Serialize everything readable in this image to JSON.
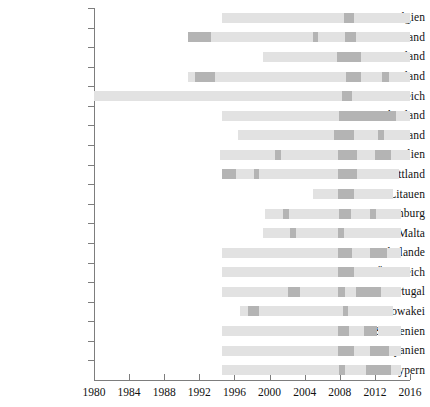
{
  "chart_data": {
    "type": "bar",
    "subtype": "horizontal-gantt-timeline",
    "title": "",
    "xlabel": "",
    "ylabel": "",
    "xlim": [
      1980,
      2016
    ],
    "xticks": [
      1980,
      1984,
      1988,
      1992,
      1996,
      2000,
      2004,
      2008,
      2012,
      2016
    ],
    "xticklabels": [
      "1980",
      "1984",
      "1988",
      "1992",
      "1996",
      "2000",
      "2004",
      "2008",
      "2012",
      "2016"
    ],
    "grid": false,
    "legend": "none",
    "colors": {
      "light": "#e2e2e2",
      "dark": "#b4b4b4",
      "axis": "#7d7d7d",
      "text": "#111111",
      "background": "#ffffff"
    },
    "categories": [
      "Belgien",
      "Deutschland",
      "Estland",
      "Finnland",
      "Frankreich",
      "Griechenland",
      "Irland",
      "Italien",
      "Lettland",
      "Litauen",
      "Luxemburg",
      "Malta",
      "Niederlande",
      "Österreich",
      "Portugal",
      "Slowakei",
      "Slowenien",
      "Spanien",
      "Zypern"
    ],
    "series": [
      {
        "name": "Belgien",
        "span": [
          1994.6,
          2016.0
        ],
        "segments": [
          {
            "start": 1994.6,
            "end": 2008.5,
            "level": "light"
          },
          {
            "start": 2008.5,
            "end": 2009.6,
            "level": "dark"
          },
          {
            "start": 2009.6,
            "end": 2016.0,
            "level": "light"
          }
        ]
      },
      {
        "name": "Deutschland",
        "span": [
          1990.7,
          2016.0
        ],
        "segments": [
          {
            "start": 1990.7,
            "end": 1993.3,
            "level": "dark"
          },
          {
            "start": 1993.3,
            "end": 2005.0,
            "level": "light"
          },
          {
            "start": 2005.0,
            "end": 2005.5,
            "level": "dark"
          },
          {
            "start": 2005.5,
            "end": 2008.6,
            "level": "light"
          },
          {
            "start": 2008.6,
            "end": 2009.8,
            "level": "dark"
          },
          {
            "start": 2009.8,
            "end": 2016.0,
            "level": "light"
          }
        ]
      },
      {
        "name": "Estland",
        "span": [
          1999.3,
          2016.0
        ],
        "segments": [
          {
            "start": 1999.3,
            "end": 2007.7,
            "level": "light"
          },
          {
            "start": 2007.7,
            "end": 2010.4,
            "level": "dark"
          },
          {
            "start": 2010.4,
            "end": 2016.0,
            "level": "light"
          }
        ]
      },
      {
        "name": "Finnland",
        "span": [
          1990.7,
          2016.0
        ],
        "segments": [
          {
            "start": 1990.7,
            "end": 1991.5,
            "level": "light"
          },
          {
            "start": 1991.5,
            "end": 1993.8,
            "level": "dark"
          },
          {
            "start": 1993.8,
            "end": 2008.7,
            "level": "light"
          },
          {
            "start": 2008.7,
            "end": 2010.4,
            "level": "dark"
          },
          {
            "start": 2010.4,
            "end": 2012.8,
            "level": "light"
          },
          {
            "start": 2012.8,
            "end": 2013.6,
            "level": "dark"
          },
          {
            "start": 2013.6,
            "end": 2016.0,
            "level": "light"
          }
        ]
      },
      {
        "name": "Frankreich",
        "span": [
          1980.0,
          2016.0
        ],
        "segments": [
          {
            "start": 1980.0,
            "end": 2008.3,
            "level": "light"
          },
          {
            "start": 2008.3,
            "end": 2009.4,
            "level": "dark"
          },
          {
            "start": 2009.4,
            "end": 2016.0,
            "level": "light"
          }
        ]
      },
      {
        "name": "Griechenland",
        "span": [
          1994.6,
          2016.0
        ],
        "segments": [
          {
            "start": 1994.6,
            "end": 2007.9,
            "level": "light"
          },
          {
            "start": 2007.9,
            "end": 2014.4,
            "level": "dark"
          },
          {
            "start": 2014.4,
            "end": 2016.0,
            "level": "light"
          }
        ]
      },
      {
        "name": "Irland",
        "span": [
          1996.4,
          2016.0
        ],
        "segments": [
          {
            "start": 1996.4,
            "end": 2007.3,
            "level": "light"
          },
          {
            "start": 2007.3,
            "end": 2009.6,
            "level": "dark"
          },
          {
            "start": 2009.6,
            "end": 2012.4,
            "level": "light"
          },
          {
            "start": 2012.4,
            "end": 2013.0,
            "level": "dark"
          },
          {
            "start": 2013.0,
            "end": 2016.0,
            "level": "light"
          }
        ]
      },
      {
        "name": "Italien",
        "span": [
          1994.4,
          2016.0
        ],
        "segments": [
          {
            "start": 1994.4,
            "end": 2000.6,
            "level": "light"
          },
          {
            "start": 2000.6,
            "end": 2001.3,
            "level": "dark"
          },
          {
            "start": 2001.3,
            "end": 2007.8,
            "level": "light"
          },
          {
            "start": 2007.8,
            "end": 2010.0,
            "level": "dark"
          },
          {
            "start": 2010.0,
            "end": 2012.0,
            "level": "light"
          },
          {
            "start": 2012.0,
            "end": 2013.8,
            "level": "dark"
          },
          {
            "start": 2013.8,
            "end": 2016.0,
            "level": "light"
          }
        ]
      },
      {
        "name": "Lettland",
        "span": [
          1994.6,
          2014.8
        ],
        "segments": [
          {
            "start": 1994.6,
            "end": 1996.2,
            "level": "dark"
          },
          {
            "start": 1996.2,
            "end": 1998.2,
            "level": "light"
          },
          {
            "start": 1998.2,
            "end": 1998.8,
            "level": "dark"
          },
          {
            "start": 1998.8,
            "end": 2007.8,
            "level": "light"
          },
          {
            "start": 2007.8,
            "end": 2010.0,
            "level": "dark"
          },
          {
            "start": 2010.0,
            "end": 2014.8,
            "level": "light"
          }
        ]
      },
      {
        "name": "Litauen",
        "span": [
          2005.0,
          2014.1
        ],
        "segments": [
          {
            "start": 2005.0,
            "end": 2007.8,
            "level": "light"
          },
          {
            "start": 2007.8,
            "end": 2009.6,
            "level": "dark"
          },
          {
            "start": 2009.6,
            "end": 2014.1,
            "level": "light"
          }
        ]
      },
      {
        "name": "Luxemburg",
        "span": [
          1999.5,
          2015.0
        ],
        "segments": [
          {
            "start": 1999.5,
            "end": 2001.5,
            "level": "light"
          },
          {
            "start": 2001.5,
            "end": 2002.2,
            "level": "dark"
          },
          {
            "start": 2002.2,
            "end": 2007.9,
            "level": "light"
          },
          {
            "start": 2007.9,
            "end": 2009.3,
            "level": "dark"
          },
          {
            "start": 2009.3,
            "end": 2011.4,
            "level": "light"
          },
          {
            "start": 2011.4,
            "end": 2012.1,
            "level": "dark"
          },
          {
            "start": 2012.1,
            "end": 2015.0,
            "level": "light"
          }
        ]
      },
      {
        "name": "Malta",
        "span": [
          1999.3,
          2015.0
        ],
        "segments": [
          {
            "start": 1999.3,
            "end": 2002.3,
            "level": "light"
          },
          {
            "start": 2002.3,
            "end": 2003.0,
            "level": "dark"
          },
          {
            "start": 2003.0,
            "end": 2007.8,
            "level": "light"
          },
          {
            "start": 2007.8,
            "end": 2008.5,
            "level": "dark"
          },
          {
            "start": 2008.5,
            "end": 2015.0,
            "level": "light"
          }
        ]
      },
      {
        "name": "Niederlande",
        "span": [
          1994.6,
          2015.0
        ],
        "segments": [
          {
            "start": 1994.6,
            "end": 2007.8,
            "level": "light"
          },
          {
            "start": 2007.8,
            "end": 2009.4,
            "level": "dark"
          },
          {
            "start": 2009.4,
            "end": 2011.4,
            "level": "light"
          },
          {
            "start": 2011.4,
            "end": 2013.4,
            "level": "dark"
          },
          {
            "start": 2013.4,
            "end": 2015.0,
            "level": "light"
          }
        ]
      },
      {
        "name": "Österreich",
        "span": [
          1994.6,
          2016.0
        ],
        "segments": [
          {
            "start": 1994.6,
            "end": 2007.8,
            "level": "light"
          },
          {
            "start": 2007.8,
            "end": 2009.6,
            "level": "dark"
          },
          {
            "start": 2009.6,
            "end": 2016.0,
            "level": "light"
          }
        ]
      },
      {
        "name": "Portugal",
        "span": [
          1994.6,
          2015.0
        ],
        "segments": [
          {
            "start": 1994.6,
            "end": 2002.1,
            "level": "light"
          },
          {
            "start": 2002.1,
            "end": 2003.5,
            "level": "dark"
          },
          {
            "start": 2003.5,
            "end": 2007.8,
            "level": "light"
          },
          {
            "start": 2007.8,
            "end": 2008.6,
            "level": "dark"
          },
          {
            "start": 2008.6,
            "end": 2009.8,
            "level": "light"
          },
          {
            "start": 2009.8,
            "end": 2012.7,
            "level": "dark"
          },
          {
            "start": 2012.7,
            "end": 2015.0,
            "level": "light"
          }
        ]
      },
      {
        "name": "Slowakei",
        "span": [
          1996.6,
          2014.1
        ],
        "segments": [
          {
            "start": 1996.6,
            "end": 1997.5,
            "level": "light"
          },
          {
            "start": 1997.5,
            "end": 1998.8,
            "level": "dark"
          },
          {
            "start": 1998.8,
            "end": 2008.4,
            "level": "light"
          },
          {
            "start": 2008.4,
            "end": 2008.9,
            "level": "dark"
          },
          {
            "start": 2008.9,
            "end": 2014.1,
            "level": "light"
          }
        ]
      },
      {
        "name": "Slowenien",
        "span": [
          1994.6,
          2015.0
        ],
        "segments": [
          {
            "start": 1994.6,
            "end": 2007.8,
            "level": "light"
          },
          {
            "start": 2007.8,
            "end": 2009.1,
            "level": "dark"
          },
          {
            "start": 2009.1,
            "end": 2010.8,
            "level": "light"
          },
          {
            "start": 2010.8,
            "end": 2012.3,
            "level": "dark"
          },
          {
            "start": 2012.3,
            "end": 2015.0,
            "level": "light"
          }
        ]
      },
      {
        "name": "Spanien",
        "span": [
          1994.6,
          2015.0
        ],
        "segments": [
          {
            "start": 1994.6,
            "end": 2007.8,
            "level": "light"
          },
          {
            "start": 2007.8,
            "end": 2009.6,
            "level": "dark"
          },
          {
            "start": 2009.6,
            "end": 2011.4,
            "level": "light"
          },
          {
            "start": 2011.4,
            "end": 2013.6,
            "level": "dark"
          },
          {
            "start": 2013.6,
            "end": 2015.0,
            "level": "light"
          }
        ]
      },
      {
        "name": "Zypern",
        "span": [
          1994.6,
          2015.0
        ],
        "segments": [
          {
            "start": 1994.6,
            "end": 2007.9,
            "level": "light"
          },
          {
            "start": 2007.9,
            "end": 2008.6,
            "level": "dark"
          },
          {
            "start": 2008.6,
            "end": 2011.0,
            "level": "light"
          },
          {
            "start": 2011.0,
            "end": 2013.8,
            "level": "dark"
          },
          {
            "start": 2013.8,
            "end": 2015.0,
            "level": "light"
          }
        ]
      }
    ]
  }
}
